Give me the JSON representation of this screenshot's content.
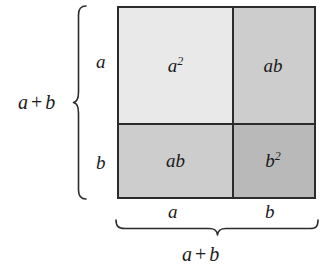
{
  "figure": {
    "background_color": "#ffffff",
    "stroke_color": "#2b2b2b"
  },
  "square": {
    "cells": [
      {
        "id": "top-left",
        "label_base": "a",
        "label_exponent": "2",
        "label_plain": "a²",
        "fill": "#e9e9e9",
        "meaning": "a squared"
      },
      {
        "id": "top-right",
        "label_base": "ab",
        "label_exponent": "",
        "label_plain": "ab",
        "fill": "#cdcdcd",
        "meaning": "a times b"
      },
      {
        "id": "bottom-left",
        "label_base": "ab",
        "label_exponent": "",
        "label_plain": "ab",
        "fill": "#cdcdcd",
        "meaning": "a times b"
      },
      {
        "id": "bottom-right",
        "label_base": "b",
        "label_exponent": "2",
        "label_plain": "b²",
        "fill": "#b9b9b9",
        "meaning": "b squared"
      }
    ]
  },
  "labels": {
    "left_side_top": "a",
    "left_side_bottom": "b",
    "left_total_first": "a",
    "left_total_operator": "+",
    "left_total_second": "b",
    "bottom_left_segment": "a",
    "bottom_right_segment": "b",
    "bottom_total_first": "a",
    "bottom_total_operator": "+",
    "bottom_total_second": "b"
  },
  "braces": {
    "left_name": "vertical-brace-a-plus-b",
    "bottom_name": "horizontal-brace-a-plus-b"
  }
}
